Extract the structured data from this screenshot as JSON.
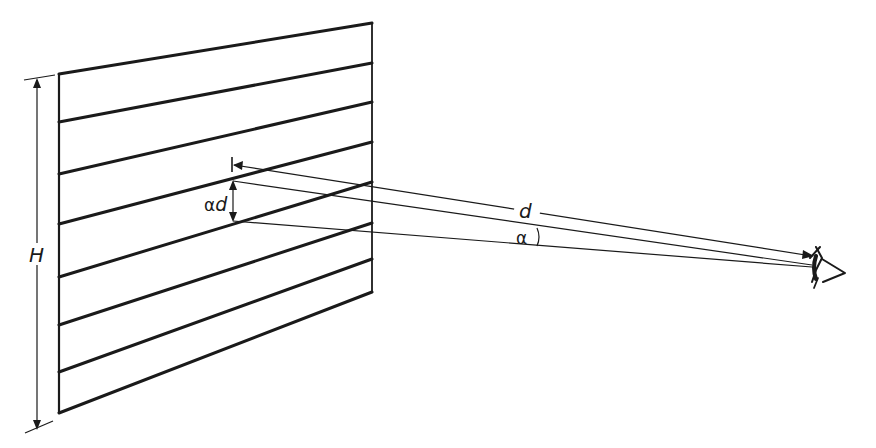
{
  "diagram": {
    "labels": {
      "height": "H",
      "distance": "d",
      "angle": "α",
      "spacing_alpha": "α",
      "spacing_d": "d"
    },
    "panel": {
      "stripe_count": 7,
      "left_edge_y": [
        74,
        122,
        175,
        224,
        277,
        326,
        372,
        413
      ],
      "right_edge_y": [
        23,
        63,
        102,
        143,
        182,
        224,
        262,
        292
      ]
    },
    "colors": {
      "ink": "#1a1a1a",
      "background": "#ffffff"
    }
  }
}
